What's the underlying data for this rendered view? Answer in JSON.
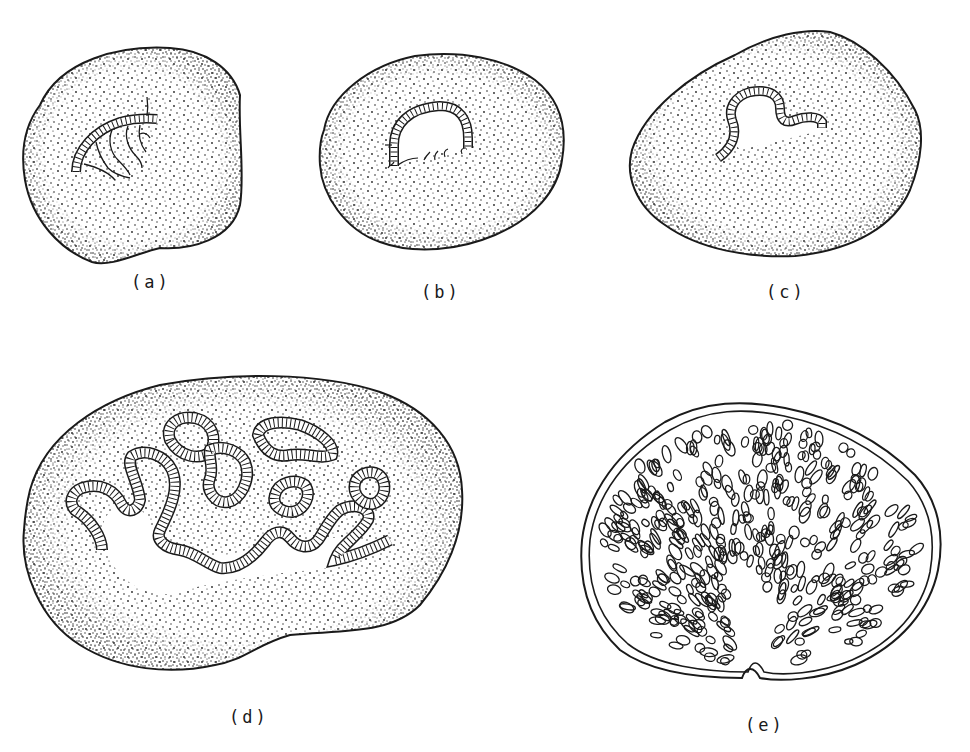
{
  "figure": {
    "panels": [
      {
        "id": "a",
        "label": "(a)",
        "description": "Stippled section with short curved banded tube and fine branching lines"
      },
      {
        "id": "b",
        "label": "(b)",
        "description": "Stippled oval section with arched banded tube"
      },
      {
        "id": "c",
        "label": "(c)",
        "description": "Stippled section with S-shaped banded tube"
      },
      {
        "id": "d",
        "label": "(d)",
        "description": "Large stippled section with highly convoluted banded tubes and lumen"
      },
      {
        "id": "e",
        "label": "(e)",
        "description": "Section filled with numerous small tubular loops, notch at base"
      }
    ],
    "colors": {
      "ink": "#1a1a1a",
      "background": "#ffffff"
    }
  }
}
